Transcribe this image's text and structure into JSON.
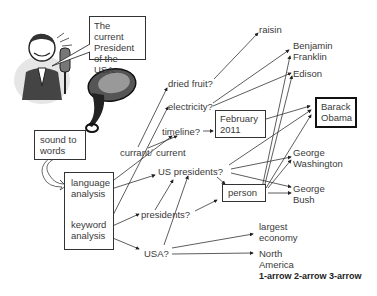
{
  "speech_bubble": "The current President of the USA.",
  "illustrations": {
    "speaker": "man-speaking-into-microphone",
    "horn": "ear-trumpet"
  },
  "process_boxes": {
    "sound_to_words": "sound to words",
    "language_analysis": "language analysis",
    "keyword_analysis": "keyword analysis"
  },
  "interpretations": {
    "dried_fruit": "dried fruit?",
    "electricity": "electricity?",
    "timeline": "timeline?",
    "currant": "currant",
    "current": "current",
    "us_presidents": "US presidents?",
    "presidents": "presidents?",
    "usa": "USA?"
  },
  "candidates": {
    "raisin": "raisin",
    "benjamin_franklin": "Benjamin Franklin",
    "edison": "Edison",
    "february_2011": "February 2011",
    "barack_obama": "Barack Obama",
    "george_washington": "George Washington",
    "person": "person",
    "george_bush": "George Bush",
    "largest_economy": "largest economy",
    "north_america": "North America"
  },
  "legend": "1-arrow 2-arrow 3-arrow"
}
